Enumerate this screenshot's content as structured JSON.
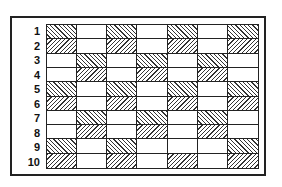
{
  "diagram": {
    "row_labels": [
      "1",
      "2",
      "3",
      "4",
      "5",
      "6",
      "7",
      "8",
      "9",
      "10"
    ],
    "columns": 7,
    "legend_codes": {
      "S": "backslash-hatch",
      "F": "forward-slash-hatch",
      "_": "blank"
    },
    "rows": [
      [
        "S",
        "_",
        "S",
        "_",
        "S",
        "_",
        "S"
      ],
      [
        "F",
        "_",
        "F",
        "_",
        "F",
        "_",
        "F"
      ],
      [
        "_",
        "S",
        "_",
        "S",
        "_",
        "S",
        "_"
      ],
      [
        "_",
        "F",
        "_",
        "F",
        "_",
        "F",
        "_"
      ],
      [
        "S",
        "_",
        "S",
        "_",
        "S",
        "_",
        "S"
      ],
      [
        "F",
        "_",
        "F",
        "_",
        "F",
        "_",
        "F"
      ],
      [
        "_",
        "S",
        "_",
        "S",
        "_",
        "S",
        "_"
      ],
      [
        "_",
        "F",
        "_",
        "F",
        "_",
        "F",
        "_"
      ],
      [
        "S",
        "_",
        "S",
        "_",
        "_",
        "_",
        "S"
      ],
      [
        "F",
        "_",
        "F",
        "_",
        "F",
        "_",
        "F"
      ]
    ]
  }
}
